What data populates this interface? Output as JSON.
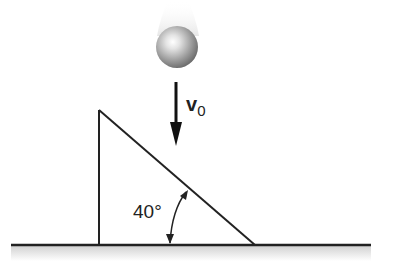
{
  "diagram": {
    "type": "physics-free-body",
    "ball": {
      "label": "",
      "color": "#9a9a9a"
    },
    "velocity_arrow": {
      "symbol": "v",
      "subscript": "0",
      "direction": "down"
    },
    "wedge": {
      "angle_label": "40°",
      "angle_degrees": 40
    },
    "ground": {
      "color": "#222222",
      "shade_color": "#d8d8d8"
    }
  }
}
